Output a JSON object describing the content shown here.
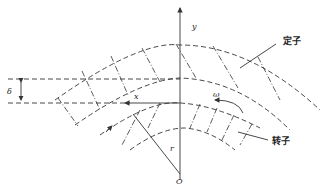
{
  "diagram": {
    "labels": {
      "y_axis": "y",
      "x_axis": "x",
      "gap": "δ",
      "angular_velocity": "ω",
      "radius": "r",
      "origin": "O",
      "stator": "定子",
      "rotor": "转子"
    },
    "colors": {
      "line": "#333333",
      "background": "#ffffff"
    }
  }
}
